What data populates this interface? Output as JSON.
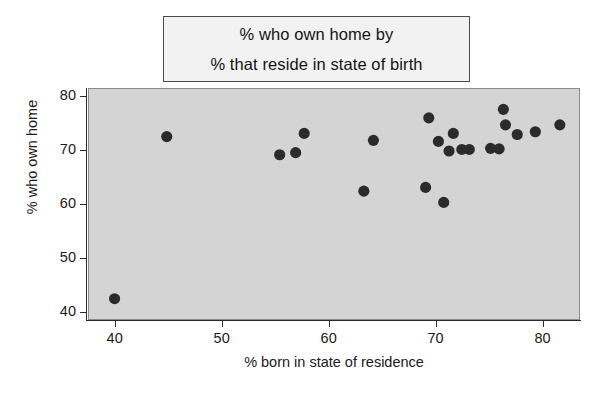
{
  "chart_data": {
    "type": "scatter",
    "title": "% who own home by % that reside in state of birth",
    "title_lines": [
      "% who own home by",
      "% that reside in state of birth"
    ],
    "xlabel": "% born in state of residence",
    "ylabel": "% who own home",
    "xlim": [
      37.5,
      83.5
    ],
    "ylim": [
      38.5,
      81.5
    ],
    "xticks": [
      40,
      50,
      60,
      70,
      80
    ],
    "yticks": [
      40,
      50,
      60,
      70,
      80
    ],
    "xtick_labels": [
      "40",
      "50",
      "60",
      "70",
      "80"
    ],
    "ytick_labels": [
      "40",
      "50",
      "60",
      "70",
      "80"
    ],
    "grid": false,
    "legend": "none",
    "marker": "filled-circle",
    "marker_color": "#2b2b2b",
    "plot_background": "#d4d4d4",
    "figure_background": "#ffffff",
    "points": [
      {
        "x": 39.9,
        "y": 42.3
      },
      {
        "x": 44.8,
        "y": 72.6
      },
      {
        "x": 55.4,
        "y": 69.2
      },
      {
        "x": 56.9,
        "y": 69.6
      },
      {
        "x": 57.7,
        "y": 73.2
      },
      {
        "x": 63.3,
        "y": 62.4
      },
      {
        "x": 64.2,
        "y": 71.9
      },
      {
        "x": 69.1,
        "y": 63.1
      },
      {
        "x": 69.4,
        "y": 76.1
      },
      {
        "x": 70.3,
        "y": 71.7
      },
      {
        "x": 70.8,
        "y": 60.3
      },
      {
        "x": 71.3,
        "y": 69.9
      },
      {
        "x": 71.7,
        "y": 73.2
      },
      {
        "x": 72.5,
        "y": 70.2
      },
      {
        "x": 73.2,
        "y": 70.2
      },
      {
        "x": 75.2,
        "y": 70.4
      },
      {
        "x": 76.0,
        "y": 70.3
      },
      {
        "x": 76.4,
        "y": 77.7
      },
      {
        "x": 76.6,
        "y": 74.8
      },
      {
        "x": 77.7,
        "y": 73.0
      },
      {
        "x": 79.4,
        "y": 73.5
      },
      {
        "x": 81.7,
        "y": 74.8
      }
    ]
  }
}
